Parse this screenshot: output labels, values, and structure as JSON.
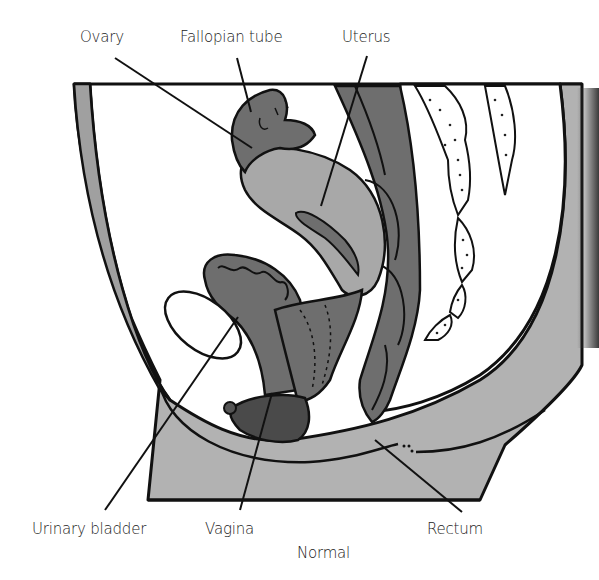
{
  "figure": {
    "caption": "Normal",
    "labels": {
      "ovary": "Ovary",
      "fallopian_tube": "Fallopian tube",
      "uterus": "Uterus",
      "urinary_bladder": "Urinary bladder",
      "vagina": "Vagina",
      "rectum": "Rectum"
    },
    "colors": {
      "organ_dark": "#6e6e6e",
      "organ_medium": "#a8a8a8",
      "tissue_light": "#b4b4b4",
      "perineum": "#4a4a4a",
      "outline": "#111111",
      "background": "#ffffff"
    }
  }
}
